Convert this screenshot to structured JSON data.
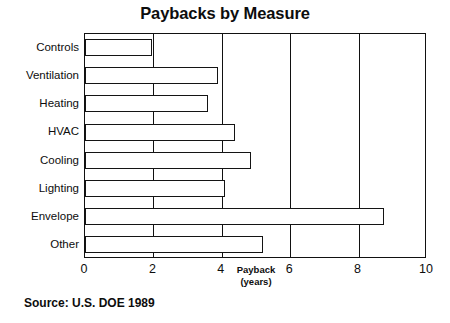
{
  "chart_data": {
    "type": "bar",
    "orientation": "horizontal",
    "title": "Paybacks by Measure",
    "xlabel": "Payback",
    "xlabel_line2": "(years)",
    "ylabel": "",
    "categories": [
      "Controls",
      "Ventilation",
      "Heating",
      "HVAC",
      "Cooling",
      "Lighting",
      "Envelope",
      "Other"
    ],
    "values": [
      1.95,
      3.9,
      3.6,
      4.4,
      4.85,
      4.1,
      8.75,
      5.2
    ],
    "xlim": [
      0,
      10
    ],
    "xticks": [
      0,
      2,
      4,
      6,
      8,
      10
    ],
    "xtick_labels": [
      "0",
      "2",
      "4",
      "6",
      "8",
      "10"
    ],
    "gridlines_x": [
      2,
      4,
      6,
      8
    ],
    "grid": true,
    "legend": false,
    "bar_fill_color": "#ffffff",
    "bar_border_color": "#141414",
    "axis_color": "#111111",
    "text_color": "#0d0d0d",
    "background_color": "#ffffff"
  },
  "source_note": "Source:  U.S. DOE 1989"
}
